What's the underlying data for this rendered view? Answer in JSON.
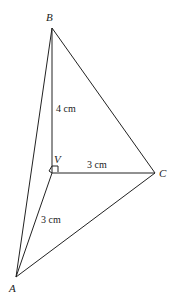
{
  "diagram": {
    "type": "tetrahedron",
    "vertices": {
      "B": {
        "label": "B",
        "x": 52,
        "y": 28
      },
      "V": {
        "label": "V",
        "x": 52,
        "y": 173
      },
      "C": {
        "label": "C",
        "x": 155,
        "y": 173
      },
      "A": {
        "label": "A",
        "x": 16,
        "y": 277
      }
    },
    "edges": [
      {
        "from": "B",
        "to": "V",
        "length_label": "4 cm"
      },
      {
        "from": "V",
        "to": "C",
        "length_label": "3 cm"
      },
      {
        "from": "V",
        "to": "A",
        "length_label": "3 cm"
      },
      {
        "from": "B",
        "to": "C"
      },
      {
        "from": "B",
        "to": "A"
      },
      {
        "from": "A",
        "to": "C"
      }
    ],
    "right_angle_marker": {
      "at": "V"
    },
    "labels": {
      "BV": "4 cm",
      "VC": "3 cm",
      "VA": "3 cm"
    }
  }
}
